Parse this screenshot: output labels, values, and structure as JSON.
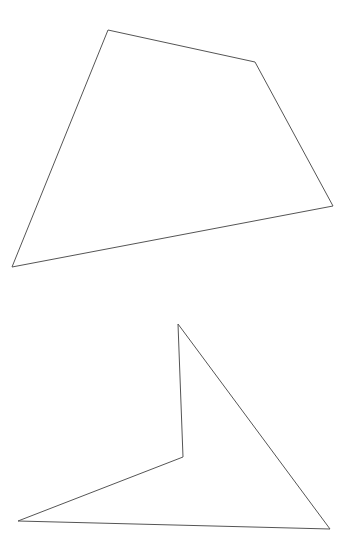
{
  "canvas": {
    "width": 354,
    "height": 552,
    "background": "#ffffff"
  },
  "stroke": {
    "color": "#555555",
    "width": 1
  },
  "shapes": [
    {
      "name": "quadrilateral",
      "points": "108,30 255,62 333,206 12,267"
    },
    {
      "name": "concave-quadrilateral",
      "points": "178,324 330,529 18,521 183,457"
    }
  ]
}
